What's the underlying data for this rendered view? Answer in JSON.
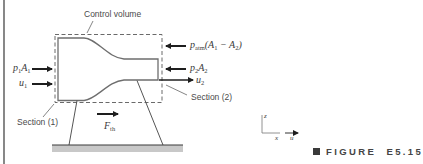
{
  "figure": {
    "caption_prefix": "FIGURE",
    "caption_number": "E5.15",
    "labels": {
      "control_volume": "Control volume",
      "section_1": "Section (1)",
      "section_2": "Section (2)",
      "p1A1": {
        "base1": "p",
        "sub1": "1",
        "base2": "A",
        "sub2": "1"
      },
      "u1": {
        "base": "u",
        "sub": "1"
      },
      "patm": {
        "base": "p",
        "sub": "atm",
        "rest": "(A",
        "sub_a": "1",
        "minus": " − A",
        "sub_b": "2",
        "close": ")"
      },
      "p2A2": {
        "base1": "p",
        "sub1": "2",
        "base2": "A",
        "sub2": "2"
      },
      "u2": {
        "base": "u",
        "sub": "2"
      },
      "Fth": {
        "base": "F",
        "sub": "th"
      },
      "axes": {
        "z": "z",
        "x": "x",
        "u": "u"
      }
    },
    "colors": {
      "line": "#5a5a5a",
      "arrow": "#1e1e1e",
      "dashed": "#6a6a6a",
      "ground_fill": "#c8c8c8",
      "text": "#4a4a4a"
    }
  }
}
